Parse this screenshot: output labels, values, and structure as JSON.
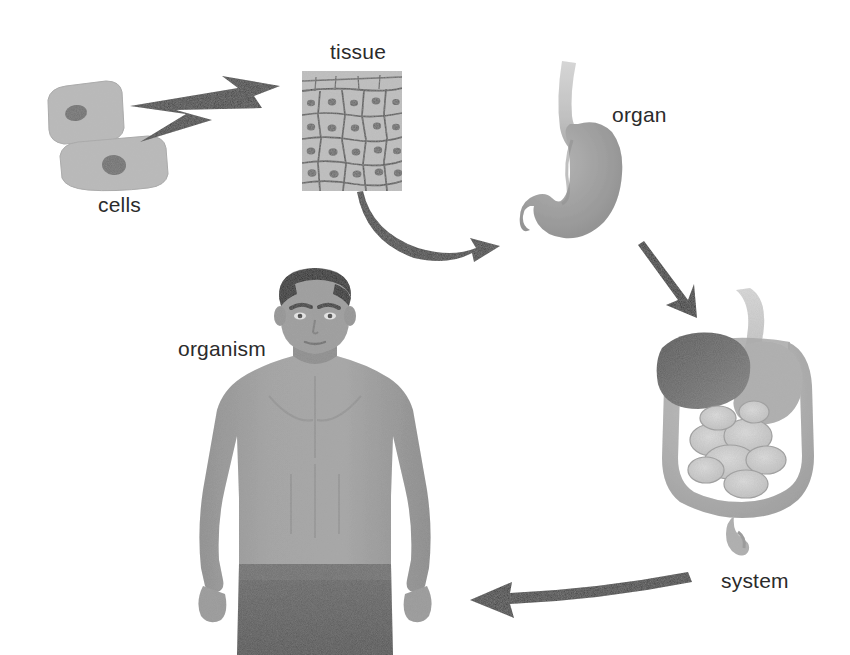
{
  "figure": {
    "background_color": "#ffffff",
    "text_color": "#2b2b2b"
  },
  "stages": [
    {
      "id": "cells",
      "label": "cells",
      "label_x": 98,
      "label_y": 196,
      "description": "two flat epithelial cells with dark nuclei",
      "fill_color": "#b8b8b8",
      "nucleus_color": "#6e6e6e"
    },
    {
      "id": "tissue",
      "label": "tissue",
      "label_x": 330,
      "label_y": 42,
      "description": "micrograph of epithelial tissue, polygonal cells in a sheet",
      "fill_color": "#bdbdbd",
      "outline_color": "#5a5a5a"
    },
    {
      "id": "organ",
      "label": "organ",
      "label_x": 612,
      "label_y": 106,
      "description": "stomach with esophagus and duodenum",
      "fill_color": "#9a9a9a",
      "esophagus_color": "#c9c9c9"
    },
    {
      "id": "system",
      "label": "system",
      "label_x": 721,
      "label_y": 572,
      "description": "digestive system: liver, stomach, large and small intestine",
      "liver_color": "#6f6f6f",
      "stomach_color": "#aaaaaa",
      "intestine_color": "#b5b5b5",
      "small_intestine_color": "#cfcfcf"
    },
    {
      "id": "organism",
      "label": "organism",
      "label_x": 178,
      "label_y": 340,
      "description": "human male torso, front view",
      "skin_color": "#9d9d9d",
      "hair_color": "#2f2f2f",
      "shorts_color": "#5e5e5e"
    }
  ],
  "arrows": [
    {
      "id": "cells-to-tissue",
      "from": "cells",
      "to": "tissue",
      "style": "zigzag-barbed",
      "color": "#3a3a3a"
    },
    {
      "id": "tissue-to-organ",
      "from": "tissue",
      "to": "organ",
      "style": "curved",
      "color": "#3a3a3a"
    },
    {
      "id": "organ-to-system",
      "from": "organ",
      "to": "system",
      "style": "straight-diagonal",
      "color": "#2e2e2e"
    },
    {
      "id": "system-to-organism",
      "from": "system",
      "to": "organism",
      "style": "curved-left",
      "color": "#3a3a3a"
    }
  ]
}
